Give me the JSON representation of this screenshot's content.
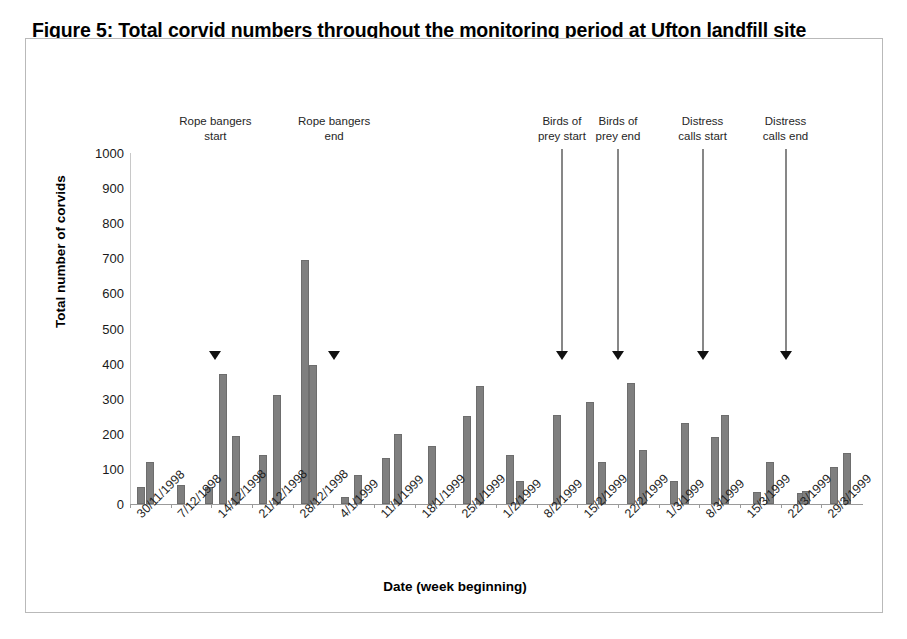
{
  "figure": {
    "title": "Figure 5: Total corvid numbers throughout the monitoring period at Ufton landfill site",
    "border_color": "#b9b9b9"
  },
  "chart_data": {
    "type": "bar",
    "title": "Figure 5: Total corvid numbers throughout the monitoring period at Ufton landfill site",
    "xlabel": "Date (week beginning)",
    "ylabel": "Total number of corvids",
    "ylim": [
      0,
      1000
    ],
    "ytick_step": 100,
    "yticks": [
      1000,
      900,
      800,
      700,
      600,
      500,
      400,
      300,
      200,
      100,
      0
    ],
    "grid": false,
    "legend": null,
    "bar_color": "#7f7f7f",
    "categories": [
      "30/11/1998",
      "7/12/1998",
      "14/12/1998",
      "21/12/1998",
      "28/12/1998",
      "4/1/1999",
      "11/1/1999",
      "18/1/1999",
      "25/1/1999",
      "1/2/1999",
      "8/2/1999",
      "15/2/1999",
      "22/2/1999",
      "1/3/1999",
      "8/3/1999",
      "15/3/1999",
      "22/3/1999",
      "29/3/1999"
    ],
    "bars": [
      {
        "x": 0.06,
        "value": 48
      },
      {
        "x": 0.3,
        "value": 120
      },
      {
        "x": 1.06,
        "value": 55
      },
      {
        "x": 1.75,
        "value": 48
      },
      {
        "x": 2.08,
        "value": 370
      },
      {
        "x": 2.42,
        "value": 195
      },
      {
        "x": 3.06,
        "value": 140
      },
      {
        "x": 3.42,
        "value": 310
      },
      {
        "x": 4.1,
        "value": 695
      },
      {
        "x": 4.3,
        "value": 395
      },
      {
        "x": 5.08,
        "value": 20
      },
      {
        "x": 5.42,
        "value": 82
      },
      {
        "x": 6.1,
        "value": 130
      },
      {
        "x": 6.4,
        "value": 200
      },
      {
        "x": 7.22,
        "value": 165
      },
      {
        "x": 8.1,
        "value": 250
      },
      {
        "x": 8.42,
        "value": 335
      },
      {
        "x": 9.14,
        "value": 140
      },
      {
        "x": 9.38,
        "value": 65
      },
      {
        "x": 10.3,
        "value": 255
      },
      {
        "x": 11.12,
        "value": 290
      },
      {
        "x": 11.4,
        "value": 120
      },
      {
        "x": 12.12,
        "value": 345
      },
      {
        "x": 12.42,
        "value": 155
      },
      {
        "x": 13.18,
        "value": 65
      },
      {
        "x": 13.46,
        "value": 230
      },
      {
        "x": 14.18,
        "value": 190
      },
      {
        "x": 14.44,
        "value": 255
      },
      {
        "x": 15.22,
        "value": 35
      },
      {
        "x": 15.54,
        "value": 120
      },
      {
        "x": 16.3,
        "value": 32
      },
      {
        "x": 16.42,
        "value": 38
      },
      {
        "x": 17.12,
        "value": 105
      },
      {
        "x": 17.44,
        "value": 145
      }
    ],
    "annotations": [
      {
        "label": "Rope bangers\nstart",
        "category_x": 2.1,
        "marker": "triangle",
        "marker_value": 410
      },
      {
        "label": "Rope bangers\nend",
        "category_x": 5.02,
        "marker": "triangle",
        "marker_value": 410
      },
      {
        "label": "Birds of\nprey start",
        "category_x": 10.62,
        "marker": "arrow",
        "marker_value": 410
      },
      {
        "label": "Birds of\nprey end",
        "category_x": 12.0,
        "marker": "arrow",
        "marker_value": 410
      },
      {
        "label": "Distress\ncalls start",
        "category_x": 14.08,
        "marker": "arrow",
        "marker_value": 410
      },
      {
        "label": "Distress\ncalls end",
        "category_x": 16.12,
        "marker": "arrow",
        "marker_value": 410
      }
    ]
  }
}
